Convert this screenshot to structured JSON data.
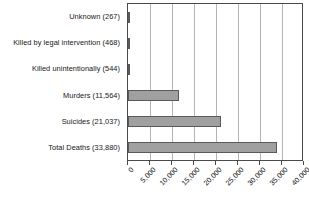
{
  "chart_data": {
    "type": "bar",
    "orientation": "horizontal",
    "title": "",
    "subtitle": "",
    "xlabel": "",
    "ylabel": "",
    "categories": [
      "Unknown (267)",
      "Killed by legal intervention (468)",
      "Killed unintentionally (544)",
      "Murders (11,564)",
      "Suicides (21,037)",
      "Total Deaths (33,880)"
    ],
    "values": [
      267,
      468,
      544,
      11564,
      21037,
      33880
    ],
    "value_labels": [
      "267",
      "468",
      "544",
      "11,564",
      "21,037",
      "33,880"
    ],
    "xlim": [
      0,
      40000
    ],
    "xticks": [
      0,
      5000,
      10000,
      15000,
      20000,
      25000,
      30000,
      35000,
      40000
    ],
    "xtick_labels": [
      "0",
      "5,000",
      "10,000",
      "15,000",
      "20,000",
      "25,000",
      "30,000",
      "35,000",
      "40,000"
    ],
    "grid": "vertical",
    "legend": "none",
    "bar_fill_color": "#a0a0a0",
    "bar_border_color": "#5a5a5a",
    "gridline_color": "#b4b4b4",
    "axis_color": "#4a4a4a",
    "background_color": "#ffffff"
  }
}
